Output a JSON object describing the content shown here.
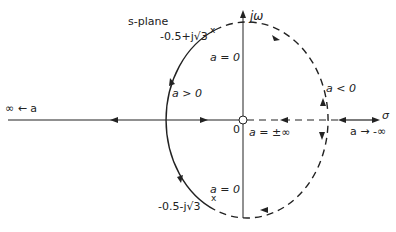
{
  "diagram": {
    "title": "s-plane",
    "axes": {
      "imag_label": "jω",
      "real_label": "σ",
      "origin_label": "0"
    },
    "points": {
      "upper_pole_label": "-0.5+j√3",
      "lower_pole_label": "-0.5-j√3"
    },
    "annotations": {
      "upper_a_zero": "a = 0",
      "lower_a_zero": "a = 0",
      "a_positive": "a > 0",
      "a_negative": "a < 0",
      "a_pm_inf": "a = ±∞",
      "left_infinity": "∞ ← a",
      "right_neg_infinity": "a → -∞"
    },
    "colors": {
      "stroke": "#222222",
      "background": "#ffffff"
    }
  }
}
